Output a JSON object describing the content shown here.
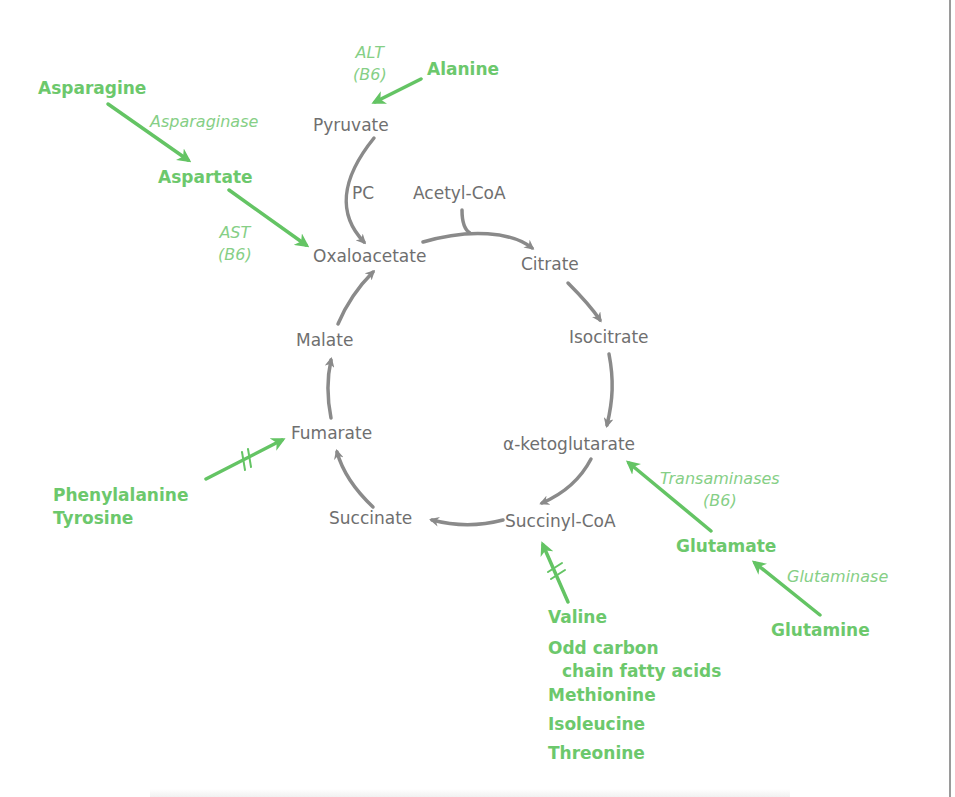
{
  "colors": {
    "metabolite_text": "#6f6f6f",
    "amino_acid_text": "#6cc86c",
    "enzyme_text": "#86cf86",
    "cycle_arrow": "#8a8a8a",
    "feed_arrow": "#64c464",
    "frame_rule": "#9a9a9a"
  },
  "cycle": {
    "pyruvate": "Pyruvate",
    "pc": "PC",
    "acetyl_coa": "Acetyl-CoA",
    "oxaloacetate": "Oxaloacetate",
    "citrate": "Citrate",
    "isocitrate": "Isocitrate",
    "alpha_ketoglutarate": "α-ketoglutarate",
    "succinyl_coa": "Succinyl-CoA",
    "succinate": "Succinate",
    "fumarate": "Fumarate",
    "malate": "Malate"
  },
  "amino_acids": {
    "asparagine": "Asparagine",
    "aspartate": "Aspartate",
    "alanine": "Alanine",
    "phenylalanine": "Phenylalanine",
    "tyrosine": "Tyrosine",
    "glutamate": "Glutamate",
    "glutamine": "Glutamine",
    "succinyl_sources": {
      "valine": "Valine",
      "odd_chain_line1": "Odd carbon",
      "odd_chain_line2": "chain fatty acids",
      "methionine": "Methionine",
      "isoleucine": "Isoleucine",
      "threonine": "Threonine"
    }
  },
  "enzymes": {
    "asparaginase": "Asparaginase",
    "ast_line1": "AST",
    "ast_line2": "(B6)",
    "alt_line1": "ALT",
    "alt_line2": "(B6)",
    "transaminases_line1": "Transaminases",
    "transaminases_line2": "(B6)",
    "glutaminase": "Glutaminase"
  },
  "markers": {
    "blocked_symbol": "double-hash (multi-step pathway)"
  }
}
